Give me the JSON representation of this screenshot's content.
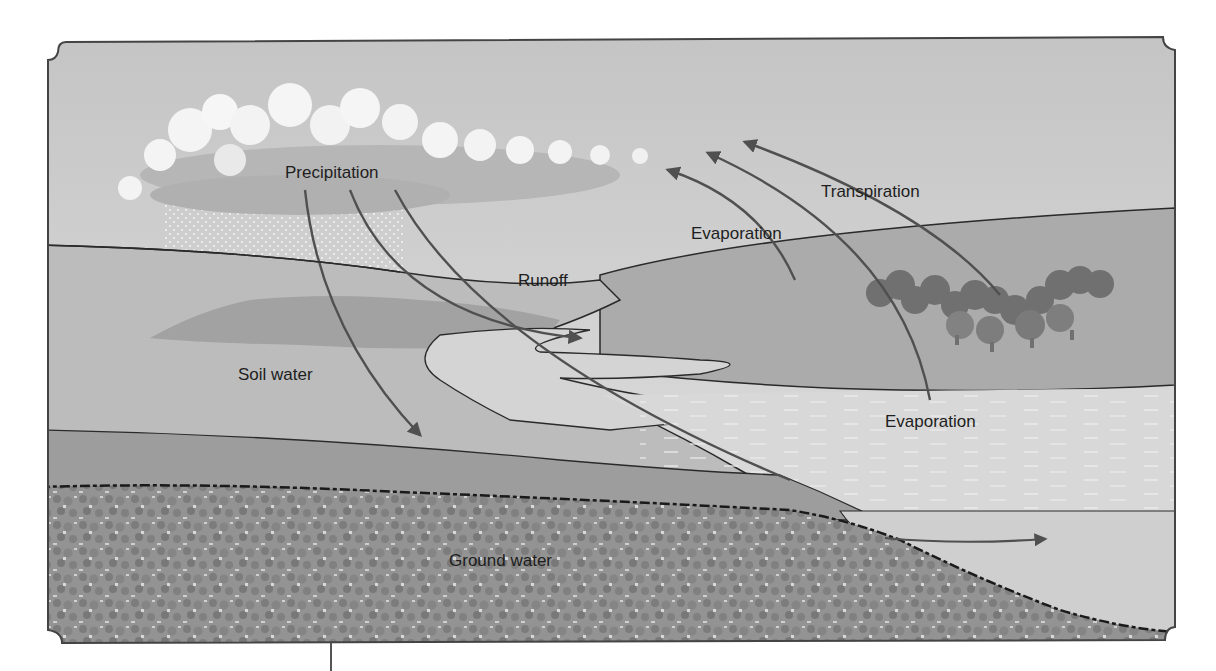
{
  "labels": {
    "precipitation": "Precipitation",
    "evaporation_upper": "Evaporation",
    "transpiration": "Transpiration",
    "runoff": "Runoff",
    "soil_water": "Soil water",
    "evaporation_lower": "Evaporation",
    "ground_water": "Ground water"
  },
  "colors": {
    "sky": "#c9c9c9",
    "sky_light": "#dcdcdc",
    "cloud": "#f4f4f4",
    "cloud_shadow": "#b4b4b4",
    "far_hill": "#a9a9a9",
    "near_land": "#b9b9b9",
    "soil_band": "#9d9d9d",
    "groundwater": "#8d8d8d",
    "water": "#d6d6d6",
    "trees": "#6f6f6f",
    "line": "#2a2a2a",
    "arrow": "#505050"
  }
}
